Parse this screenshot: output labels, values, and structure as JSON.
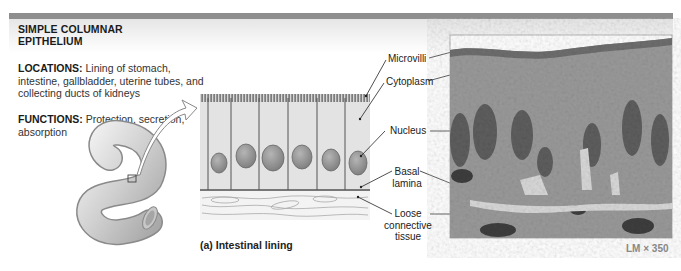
{
  "figure": {
    "title_line1": "SIMPLE  COLUMNAR",
    "title_line2": "EPITHELIUM",
    "locations_label": "LOCATIONS:",
    "locations_text": " Lining of stomach, intestine, gallbladder, uterine tubes, and collecting ducts of kidneys",
    "functions_label": "FUNCTIONS:",
    "functions_text": " Protection, secretion, absorption",
    "caption": "(a) Intestinal lining",
    "magnification": "LM × 350",
    "labels": {
      "microvilli": "Microvilli",
      "cytoplasm": "Cytoplasm",
      "nucleus": "Nucleus",
      "basal_lamina_1": "Basal",
      "basal_lamina_2": "lamina",
      "loose_1": "Loose",
      "loose_2": "connective",
      "loose_3": "tissue"
    },
    "colors": {
      "header_bar": "#8e8e8e",
      "cell_fill": "#e3e3e3",
      "nucleus_fill": "#9a9a9a",
      "micrograph_base": "#8f8f8f"
    }
  }
}
